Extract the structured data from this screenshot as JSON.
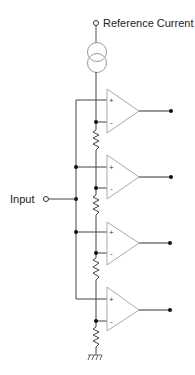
{
  "diagram": {
    "type": "circuit-schematic",
    "labels": {
      "reference": "Reference Current",
      "input": "Input"
    },
    "comparators": [
      {
        "id": "comp-1",
        "plus": "+",
        "minus": "-"
      },
      {
        "id": "comp-2",
        "plus": "+",
        "minus": "-"
      },
      {
        "id": "comp-3",
        "plus": "+",
        "minus": "-"
      },
      {
        "id": "comp-4",
        "plus": "+",
        "minus": "-"
      }
    ],
    "components": [
      "current-source",
      "resistor-1",
      "resistor-2",
      "resistor-3",
      "resistor-4",
      "ground"
    ],
    "colors": {
      "wire": "#333333",
      "opamp": "#aaaaaa",
      "source": "#999999",
      "node": "#111111"
    }
  }
}
